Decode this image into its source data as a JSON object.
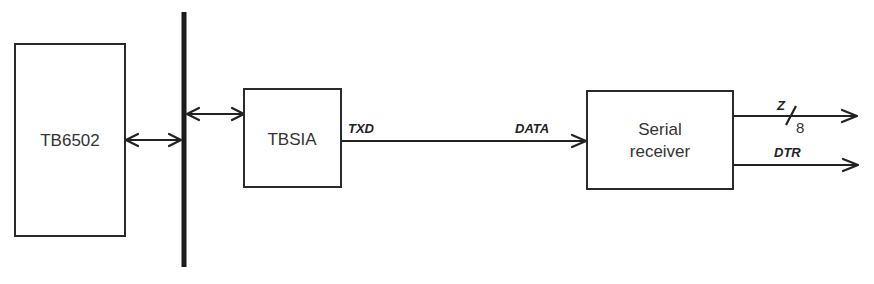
{
  "diagram": {
    "type": "block-diagram",
    "blocks": [
      {
        "id": "cpu",
        "label": "TB6502"
      },
      {
        "id": "sia",
        "label": "TBSIA"
      },
      {
        "id": "rx",
        "label_line1": "Serial",
        "label_line2": "receiver"
      }
    ],
    "bus": {
      "name": "system-bus"
    },
    "connections": [
      {
        "from": "cpu",
        "to": "bus",
        "direction": "bidirectional"
      },
      {
        "from": "bus",
        "to": "sia",
        "direction": "bidirectional"
      },
      {
        "from": "sia",
        "to": "rx",
        "direction": "forward",
        "source_label": "TXD",
        "target_label": "DATA"
      },
      {
        "from": "rx",
        "to": "output",
        "direction": "forward",
        "label": "Z",
        "bus_width": "8"
      },
      {
        "from": "rx",
        "to": "output",
        "direction": "forward",
        "label": "DTR"
      }
    ],
    "colors": {
      "stroke": "#222222",
      "background": "#ffffff",
      "text": "#333333"
    }
  }
}
